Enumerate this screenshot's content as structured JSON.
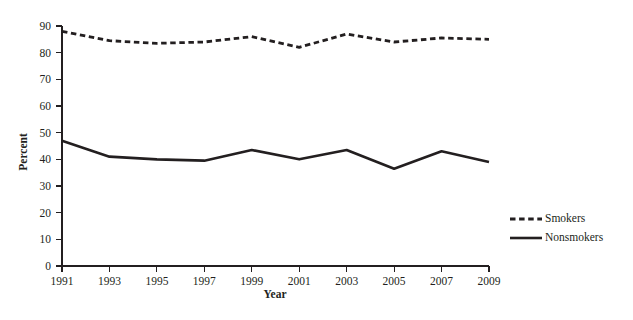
{
  "chart_data": {
    "type": "line",
    "title": "",
    "xlabel": "Year",
    "ylabel": "Percent",
    "x": [
      1991,
      1993,
      1995,
      1997,
      1999,
      2001,
      2003,
      2005,
      2007,
      2009
    ],
    "categories": [
      "1991",
      "1993",
      "1995",
      "1997",
      "1999",
      "2001",
      "2003",
      "2005",
      "2007",
      "2009"
    ],
    "series": [
      {
        "name": "Smokers",
        "style": "dashed",
        "values": [
          88,
          84.5,
          83.5,
          84,
          86,
          82,
          87,
          84,
          85.5,
          85
        ]
      },
      {
        "name": "Nonsmokers",
        "style": "solid",
        "values": [
          47,
          41,
          40,
          39.5,
          43.5,
          40,
          43.5,
          36.5,
          43,
          39
        ]
      }
    ],
    "xlim": [
      1991,
      2009
    ],
    "ylim": [
      0,
      90
    ],
    "ytick_values": [
      0,
      10,
      20,
      30,
      40,
      50,
      60,
      70,
      80,
      90
    ],
    "ytick_labels": [
      "0",
      "10",
      "20",
      "30",
      "40",
      "50",
      "60",
      "70",
      "80",
      "90"
    ],
    "xtick_labels": [
      "1991",
      "1993",
      "1995",
      "1997",
      "1999",
      "2001",
      "2003",
      "2005",
      "2007",
      "2009"
    ],
    "grid": false,
    "legend_position": "right-lower",
    "line_color": "#231f20",
    "background_color": "#ffffff"
  },
  "legend": {
    "entries": [
      {
        "label": "Smokers",
        "style": "dashed"
      },
      {
        "label": "Nonsmokers",
        "style": "solid"
      }
    ]
  }
}
